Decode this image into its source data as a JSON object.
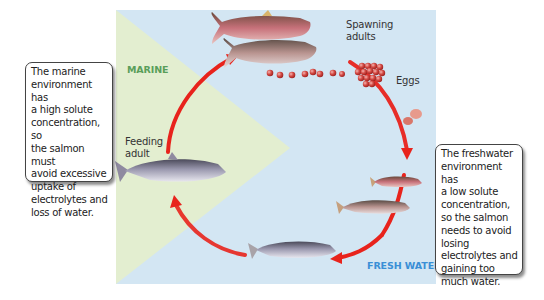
{
  "diagram": {
    "zones": {
      "marine": {
        "label": "MARINE",
        "color": "#5a9e5a",
        "fill": "#e2edcf"
      },
      "freshwater": {
        "label": "FRESH WATER",
        "color": "#3a8fd6",
        "fill": "#d3e6f3"
      }
    },
    "stages": [
      {
        "id": "spawning-adults",
        "label_line1": "Spawning",
        "label_line2": "adults"
      },
      {
        "id": "eggs",
        "label": "Eggs"
      },
      {
        "id": "alevin",
        "label": ""
      },
      {
        "id": "fry",
        "label": ""
      },
      {
        "id": "parr",
        "label": ""
      },
      {
        "id": "smolt",
        "label": ""
      },
      {
        "id": "feeding-adult",
        "label_line1": "Feeding",
        "label_line2": "adult"
      }
    ],
    "arrow_color": "#e8231c",
    "callouts": {
      "marine": {
        "lines": [
          "The marine",
          "environment has",
          "a high solute",
          "concentration, so",
          "the salmon must",
          "avoid excessive",
          "uptake of",
          "electrolytes and",
          "loss of water."
        ]
      },
      "freshwater": {
        "lines": [
          "The freshwater",
          "environment has",
          "a low solute",
          "concentration,",
          "so the salmon",
          "needs to avoid",
          "losing",
          "electrolytes and",
          "gaining too",
          "much water."
        ]
      }
    }
  }
}
